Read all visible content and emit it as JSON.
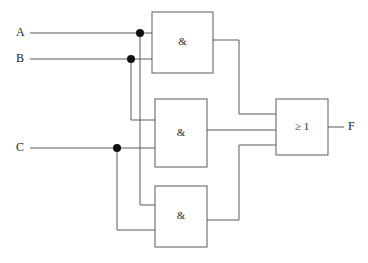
{
  "diagram": {
    "type": "logic-circuit-schematic",
    "notation": "IEC / DIN rectangular symbols",
    "background_color": "#ffffff",
    "line_color": "#5a5a5a",
    "dot_color": "#101010",
    "boolean_function": "F = (A ∧ B) ∨ (B ∧ C) ∨ (A ∧ C)"
  },
  "inputs": [
    {
      "id": "A",
      "label": "A",
      "label_x": 16,
      "label_y": 33,
      "wire_y": 33,
      "wire_start_x": 30,
      "junction_x": 140
    },
    {
      "id": "B",
      "label": "B",
      "label_x": 16,
      "label_y": 59,
      "wire_y": 59,
      "wire_start_x": 30,
      "junction_x": 131
    },
    {
      "id": "C",
      "label": "C",
      "label_x": 16,
      "label_y": 148,
      "wire_y": 148,
      "wire_start_x": 30,
      "junction_x": 117
    }
  ],
  "outputs": [
    {
      "id": "F",
      "label": "F",
      "label_x": 348,
      "label_y": 127,
      "wire_y": 127,
      "wire_start_x": 328,
      "wire_end_x": 344
    }
  ],
  "gates": [
    {
      "id": "and1",
      "name": "and-gate-1",
      "symbol": "&",
      "function": "AND",
      "x": 152,
      "y": 12,
      "width": 61,
      "height": 61,
      "inputs": [
        {
          "from": "A",
          "y": 33
        },
        {
          "from": "B",
          "y": 59
        }
      ],
      "output": {
        "y": 40,
        "to": "or1"
      }
    },
    {
      "id": "and2",
      "name": "and-gate-2",
      "symbol": "&",
      "function": "AND",
      "x": 155,
      "y": 99,
      "width": 52,
      "height": 68,
      "inputs": [
        {
          "from": "B",
          "y": 120
        },
        {
          "from": "C",
          "y": 148
        }
      ],
      "output": {
        "y": 130,
        "to": "or1"
      }
    },
    {
      "id": "and3",
      "name": "and-gate-3",
      "symbol": "&",
      "function": "AND",
      "x": 155,
      "y": 186,
      "width": 52,
      "height": 61,
      "inputs": [
        {
          "from": "A",
          "y": 205
        },
        {
          "from": "C",
          "y": 230
        }
      ],
      "output": {
        "y": 220,
        "to": "or1"
      }
    },
    {
      "id": "or1",
      "name": "or-gate",
      "symbol": "≥ 1",
      "function": "OR",
      "x": 276,
      "y": 99,
      "width": 52,
      "height": 56,
      "inputs": [
        {
          "from": "and1",
          "y": 114
        },
        {
          "from": "and2",
          "y": 130
        },
        {
          "from": "and3",
          "y": 145
        }
      ],
      "output": {
        "y": 127,
        "to": "F"
      }
    }
  ],
  "junctions": [
    {
      "id": "j-a",
      "on": "A",
      "x": 140,
      "y": 33,
      "r": 4
    },
    {
      "id": "j-b",
      "on": "B",
      "x": 131,
      "y": 59,
      "r": 4
    },
    {
      "id": "j-c",
      "on": "C",
      "x": 117,
      "y": 148,
      "r": 4
    }
  ],
  "wires": [
    {
      "id": "w-a-main",
      "name": "wire-input-a",
      "d": "M 30 33 L 152 33"
    },
    {
      "id": "w-a-down",
      "name": "wire-a-branch-to-and3",
      "d": "M 140 33 L 140 205 L 155 205"
    },
    {
      "id": "w-b-main",
      "name": "wire-input-b",
      "d": "M 30 59 L 152 59"
    },
    {
      "id": "w-b-down",
      "name": "wire-b-branch-to-and2",
      "d": "M 131 59 L 131 120 L 155 120"
    },
    {
      "id": "w-c-main",
      "name": "wire-input-c",
      "d": "M 30 148 L 155 148"
    },
    {
      "id": "w-c-down",
      "name": "wire-c-branch-to-and3",
      "d": "M 117 148 L 117 230 L 155 230"
    },
    {
      "id": "w-and1-out",
      "name": "wire-and1-output-to-or",
      "d": "M 213 40 L 239 40 L 239 114 L 276 114"
    },
    {
      "id": "w-and2-out",
      "name": "wire-and2-output-to-or",
      "d": "M 207 130 L 276 130"
    },
    {
      "id": "w-and3-out",
      "name": "wire-and3-output-to-or",
      "d": "M 207 220 L 239 220 L 239 145 L 276 145"
    },
    {
      "id": "w-or-out",
      "name": "wire-or-output-to-f",
      "d": "M 328 127 L 344 127"
    }
  ]
}
